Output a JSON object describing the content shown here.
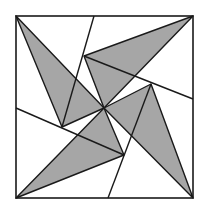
{
  "figure": {
    "colors": {
      "shade": "#a6a6a6",
      "stroke": "#1a1a1a",
      "background": "#ffffff"
    },
    "square": {
      "x1": 16,
      "y1": 16,
      "x2": 193,
      "y2": 198
    },
    "center": [
      104,
      108
    ],
    "shaded_triangles": [
      {
        "name": "top-left",
        "points": "16,16 104,108 62,127"
      },
      {
        "name": "top-right",
        "points": "193,16 84,56 104,108"
      },
      {
        "name": "bottom-right",
        "points": "193,198 151,84 104,108"
      },
      {
        "name": "bottom-left",
        "points": "16,198 124,155 104,108"
      }
    ],
    "edge_lines": [
      {
        "name": "top",
        "x1": 94,
        "y1": 16,
        "x2": 62,
        "y2": 127
      },
      {
        "name": "right",
        "x1": 193,
        "y1": 99,
        "x2": 84,
        "y2": 56
      },
      {
        "name": "bottom",
        "x1": 108,
        "y1": 198,
        "x2": 151,
        "y2": 84
      },
      {
        "name": "left",
        "x1": 16,
        "y1": 108,
        "x2": 124,
        "y2": 155
      }
    ]
  }
}
